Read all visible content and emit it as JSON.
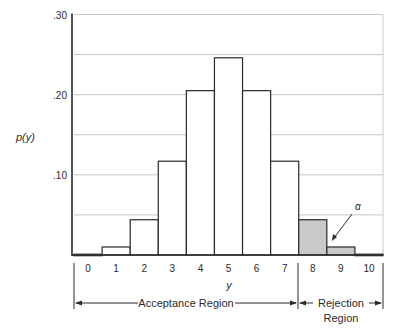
{
  "chart_data": {
    "type": "bar",
    "title": "",
    "xlabel": "y",
    "ylabel": "p(y)",
    "categories": [
      "0",
      "1",
      "2",
      "3",
      "4",
      "5",
      "6",
      "7",
      "8",
      "9",
      "10"
    ],
    "values": [
      0.001,
      0.01,
      0.044,
      0.117,
      0.205,
      0.246,
      0.205,
      0.117,
      0.044,
      0.01,
      0.001
    ],
    "ylim": [
      0,
      0.3
    ],
    "yticks": [
      ".10",
      ".20",
      ".30"
    ],
    "ytick_values": [
      0.1,
      0.2,
      0.3
    ],
    "grid": true,
    "grid_step": 0.05,
    "shaded_categories": [
      "8",
      "9",
      "10"
    ],
    "annotations": [
      {
        "text": "α",
        "points_to": "9",
        "meaning": "rejection-region probability"
      }
    ],
    "regions": [
      {
        "label_line1": "Acceptance Region",
        "label_line2": "",
        "from": "0",
        "to": "7"
      },
      {
        "label_line1": "Rejection",
        "label_line2": "Region",
        "from": "8",
        "to": "10"
      }
    ]
  },
  "colors": {
    "bar_fill": "#ffffff",
    "shaded_fill": "#c9c9c9",
    "bar_stroke": "#2a2a2a",
    "grid": "#c8c8c8"
  }
}
